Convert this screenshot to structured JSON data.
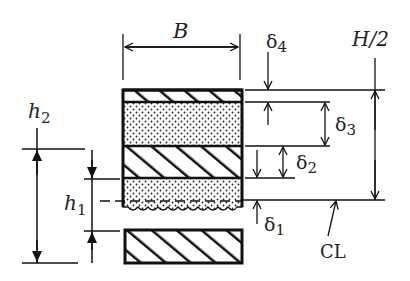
{
  "diagram": {
    "labels": {
      "width": "B",
      "delta4": "δ",
      "delta4_sub": "4",
      "half_height": "H/2",
      "delta3": "δ",
      "delta3_sub": "3",
      "delta2": "δ",
      "delta2_sub": "2",
      "delta1": "δ",
      "delta1_sub": "1",
      "centerline": "CL",
      "h2": "h",
      "h2_sub": "2",
      "h1": "h",
      "h1_sub": "1"
    },
    "layers": [
      {
        "name": "top-hatched-layer",
        "pattern": "hatch"
      },
      {
        "name": "upper-dotted-layer",
        "pattern": "dots"
      },
      {
        "name": "middle-hatched-layer",
        "pattern": "hatch"
      },
      {
        "name": "lower-dotted-layer",
        "pattern": "dots"
      },
      {
        "name": "bottom-hatched-layer",
        "pattern": "hatch"
      }
    ],
    "colors": {
      "ink": "#111111",
      "background": "#ffffff"
    }
  }
}
